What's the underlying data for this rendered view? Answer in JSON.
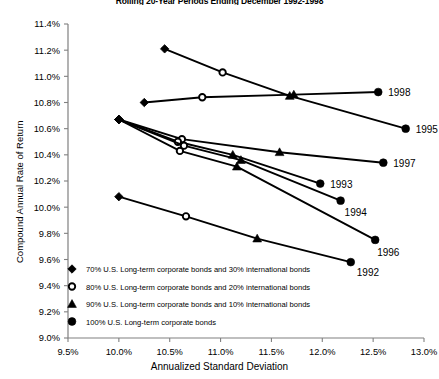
{
  "chart_data": {
    "type": "line",
    "title": "Rolling 20-Year Periods Ending December 1992-1998",
    "xlabel": "Annualized Standard Deviation",
    "ylabel": "Compound Annual Rate of Return",
    "xlim": [
      9.5,
      13.0
    ],
    "ylim": [
      9.0,
      11.4
    ],
    "xticks": [
      "9.5%",
      "10.0%",
      "10.5%",
      "11.0%",
      "11.5%",
      "12.0%",
      "12.5%",
      "13.0%"
    ],
    "xtick_values": [
      9.5,
      10.0,
      10.5,
      11.0,
      11.5,
      12.0,
      12.5,
      13.0
    ],
    "yticks": [
      "9.0%",
      "9.2%",
      "9.4%",
      "9.6%",
      "9.8%",
      "10.0%",
      "10.2%",
      "10.4%",
      "10.6%",
      "10.8%",
      "11.0%",
      "11.2%",
      "11.4%"
    ],
    "ytick_values": [
      9.0,
      9.2,
      9.4,
      9.6,
      9.8,
      10.0,
      10.2,
      10.4,
      10.6,
      10.8,
      11.0,
      11.2,
      11.4
    ],
    "grid": false,
    "legend_position": "bottom-left",
    "markers": [
      "diamond",
      "open-circle",
      "triangle",
      "filled-circle"
    ],
    "series": [
      {
        "name": "1995",
        "label": "1995",
        "points": [
          {
            "x": 10.45,
            "y": 11.21,
            "marker": "diamond",
            "allocation": "70/30"
          },
          {
            "x": 11.02,
            "y": 11.03,
            "marker": "open-circle",
            "allocation": "80/20"
          },
          {
            "x": 11.68,
            "y": 10.85,
            "marker": "triangle",
            "allocation": "90/10"
          },
          {
            "x": 12.82,
            "y": 10.6,
            "marker": "filled-circle",
            "allocation": "100"
          }
        ]
      },
      {
        "name": "1998",
        "label": "1998",
        "points": [
          {
            "x": 10.25,
            "y": 10.8,
            "marker": "diamond",
            "allocation": "70/30"
          },
          {
            "x": 10.82,
            "y": 10.84,
            "marker": "open-circle",
            "allocation": "80/20"
          },
          {
            "x": 11.72,
            "y": 10.86,
            "marker": "triangle",
            "allocation": "90/10"
          },
          {
            "x": 12.55,
            "y": 10.88,
            "marker": "filled-circle",
            "allocation": "100"
          }
        ]
      },
      {
        "name": "1997",
        "label": "1997",
        "points": [
          {
            "x": 10.0,
            "y": 10.67,
            "marker": "diamond",
            "allocation": "70/30"
          },
          {
            "x": 10.62,
            "y": 10.52,
            "marker": "open-circle",
            "allocation": "80/20"
          },
          {
            "x": 11.58,
            "y": 10.42,
            "marker": "triangle",
            "allocation": "90/10"
          },
          {
            "x": 12.6,
            "y": 10.34,
            "marker": "filled-circle",
            "allocation": "100"
          }
        ]
      },
      {
        "name": "1993",
        "label": "1993",
        "points": [
          {
            "x": 10.0,
            "y": 10.67,
            "marker": "diamond",
            "allocation": "70/30"
          },
          {
            "x": 10.58,
            "y": 10.5,
            "marker": "open-circle",
            "allocation": "80/20"
          },
          {
            "x": 11.12,
            "y": 10.4,
            "marker": "triangle",
            "allocation": "90/10"
          },
          {
            "x": 11.98,
            "y": 10.18,
            "marker": "filled-circle",
            "allocation": "100"
          }
        ]
      },
      {
        "name": "1994",
        "label": "1994",
        "points": [
          {
            "x": 10.0,
            "y": 10.67,
            "marker": "diamond",
            "allocation": "70/30"
          },
          {
            "x": 10.64,
            "y": 10.47,
            "marker": "open-circle",
            "allocation": "80/20"
          },
          {
            "x": 11.2,
            "y": 10.36,
            "marker": "triangle",
            "allocation": "90/10"
          },
          {
            "x": 12.18,
            "y": 10.05,
            "marker": "filled-circle",
            "allocation": "100"
          }
        ]
      },
      {
        "name": "1996",
        "label": "1996",
        "points": [
          {
            "x": 10.0,
            "y": 10.67,
            "marker": "diamond",
            "allocation": "70/30"
          },
          {
            "x": 10.6,
            "y": 10.43,
            "marker": "open-circle",
            "allocation": "80/20"
          },
          {
            "x": 11.16,
            "y": 10.31,
            "marker": "triangle",
            "allocation": "90/10"
          },
          {
            "x": 12.52,
            "y": 9.75,
            "marker": "filled-circle",
            "allocation": "100"
          }
        ]
      },
      {
        "name": "1992",
        "label": "1992",
        "points": [
          {
            "x": 10.0,
            "y": 10.08,
            "marker": "diamond",
            "allocation": "70/30"
          },
          {
            "x": 10.66,
            "y": 9.93,
            "marker": "open-circle",
            "allocation": "80/20"
          },
          {
            "x": 11.36,
            "y": 9.76,
            "marker": "triangle",
            "allocation": "90/10"
          },
          {
            "x": 12.28,
            "y": 9.58,
            "marker": "filled-circle",
            "allocation": "100"
          }
        ]
      }
    ],
    "legend": [
      {
        "marker": "diamond",
        "label": "70% U.S. Long-term corporate bonds and 30% international bonds"
      },
      {
        "marker": "open-circle",
        "label": "80% U.S. Long-term corporate bonds and 20% international bonds"
      },
      {
        "marker": "triangle",
        "label": "90% U.S. Long-term corporate bonds and 10% international bonds"
      },
      {
        "marker": "filled-circle",
        "label": "100% U.S. Long-term corporate bonds"
      }
    ]
  },
  "colors": {
    "line": "#000000",
    "axis": "#808080",
    "text": "#000000",
    "background": "#ffffff"
  }
}
